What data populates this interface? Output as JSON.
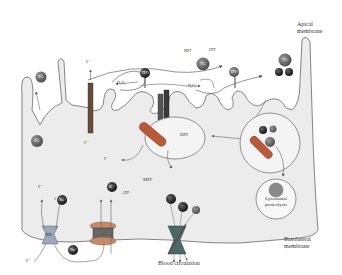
{
  "diagram": {
    "regions": {
      "apical_membrane": "Apical\nmembrane",
      "basolateral_membrane": "Basolateral\nmembrane",
      "blood_circulation": "Blood circulation",
      "lysosome": "Lysosomal\nproteolysis"
    },
    "molecules": {
      "tg": "TG",
      "tpo": "TPO",
      "iodide": "I⁻",
      "h2o2": "H₂O₂",
      "mit": "MIT",
      "dit": "DIT",
      "nis": "NIS",
      "na": "Na⁺",
      "k": "K⁺",
      "atp": "ATP",
      "two": "2",
      "duox": "DUOX",
      "dehal": "DEHAL1",
      "t3": "T3",
      "t4": "T4",
      "tg_t3t4": "TG"
    },
    "colors": {
      "cell_fill": "#ececec",
      "membrane": "#777777",
      "tg_ball": "#6e6e6e",
      "dark_ball": "#222222",
      "arrow": "#555555",
      "lysosome_core": "#8a8a8a"
    }
  }
}
